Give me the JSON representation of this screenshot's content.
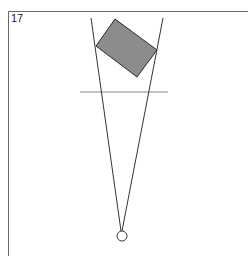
{
  "figure": {
    "label": "17",
    "colors": {
      "frame": "#6a6a6a",
      "rect_fill": "#8c8c8c",
      "rect_stroke": "#2a2a2a",
      "lines": "#333333",
      "bar": "#c4c4c4",
      "circle_stroke": "#333333"
    },
    "rectangle": {
      "points": "115,19 157,50 137,77 96,46"
    },
    "sight_lines": [
      {
        "x1": 91,
        "y1": 18,
        "x2": 121,
        "y2": 231
      },
      {
        "x1": 163,
        "y1": 18,
        "x2": 122,
        "y2": 231
      }
    ],
    "horizontal_bar": {
      "x1": 80,
      "y1": 92,
      "x2": 168,
      "y2": 92
    },
    "eye_circle": {
      "cx": 122,
      "cy": 236,
      "r": 5
    }
  }
}
